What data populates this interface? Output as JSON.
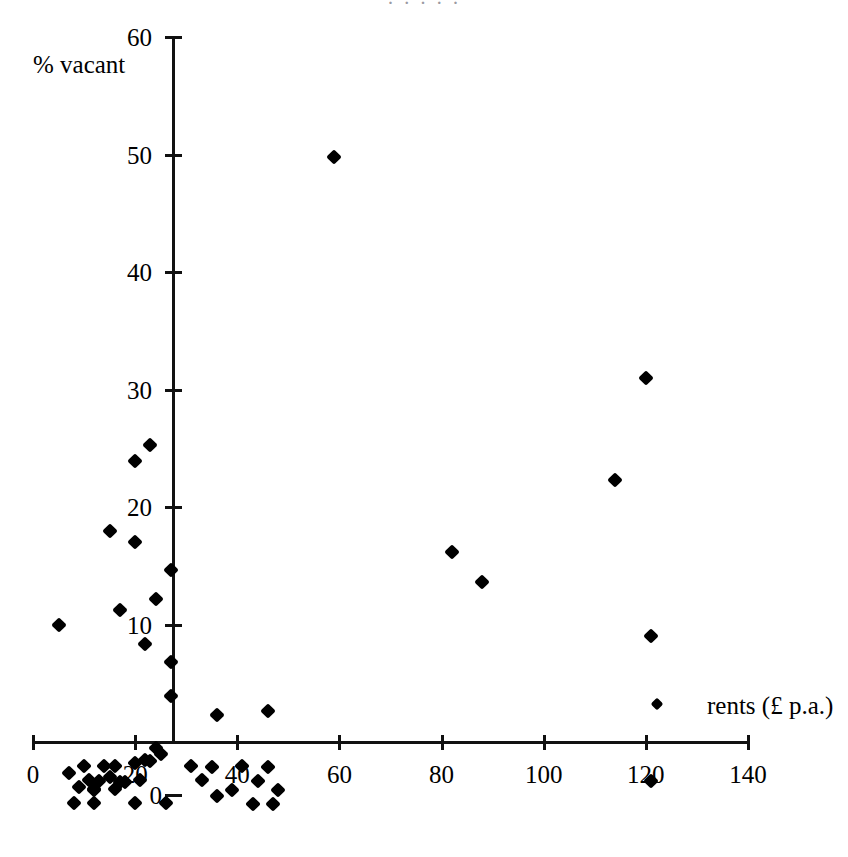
{
  "figure": {
    "background_color": "#ffffff",
    "ink_color": "#000000",
    "width": 848,
    "height": 857,
    "cropped_caption_remnant": "· ·   ·    ·    ·"
  },
  "axes": {
    "y_axis_title": "% vacant",
    "x_axis_title": "rents (£ p.a.)",
    "x_ticks": [
      0,
      20,
      40,
      60,
      80,
      100,
      120,
      140
    ],
    "y_ticks": [
      0,
      10,
      20,
      30,
      40,
      50,
      60
    ],
    "x_tick_labels": [
      "0",
      "20",
      "40",
      "60",
      "80",
      "100",
      "120",
      "140"
    ],
    "y_tick_labels": [
      "0",
      "10",
      "20",
      "30",
      "40",
      "50",
      "60"
    ],
    "x_origin_px": 33,
    "x_scale_px_per_unit": 5.107,
    "y_origin_px": 742,
    "y_scale_px_per_unit": 11.75,
    "xlim": [
      0,
      140
    ],
    "ylim": [
      -6,
      60
    ],
    "grid": false
  },
  "legend": {
    "marker_label": "rents (£ p.a.)",
    "marker_x_px": 657,
    "marker_y_px": 704
  },
  "chart_data": {
    "type": "scatter",
    "title": "",
    "xlabel": "rents (£ p.a.)",
    "ylabel": "% vacant",
    "xlim": [
      0,
      140
    ],
    "ylim": [
      -6,
      60
    ],
    "grid": false,
    "legend_position": "inside-right",
    "series": [
      {
        "name": "rents (£ p.a.)",
        "marker": "diamond",
        "color": "#000000",
        "points": [
          [
            59,
            49.8
          ],
          [
            120,
            31.0
          ],
          [
            114,
            22.3
          ],
          [
            82,
            16.2
          ],
          [
            88,
            13.6
          ],
          [
            121,
            9.0
          ],
          [
            121,
            -3.3
          ],
          [
            23,
            25.3
          ],
          [
            20,
            23.9
          ],
          [
            15,
            18.0
          ],
          [
            20,
            17.0
          ],
          [
            27,
            14.6
          ],
          [
            24,
            12.2
          ],
          [
            17,
            11.2
          ],
          [
            5,
            10.0
          ],
          [
            22,
            8.3
          ],
          [
            27,
            6.8
          ],
          [
            27,
            3.9
          ],
          [
            36,
            2.3
          ],
          [
            46,
            2.6
          ],
          [
            24,
            -0.5
          ],
          [
            25,
            -1.0
          ],
          [
            22,
            -1.5
          ],
          [
            23,
            -1.6
          ],
          [
            20,
            -1.8
          ],
          [
            10,
            -2.0
          ],
          [
            14,
            -2.0
          ],
          [
            16,
            -2.0
          ],
          [
            31,
            -2.0
          ],
          [
            35,
            -2.1
          ],
          [
            41,
            -2.0
          ],
          [
            46,
            -2.1
          ],
          [
            7,
            -2.6
          ],
          [
            15,
            -3.0
          ],
          [
            11,
            -3.2
          ],
          [
            13,
            -3.3
          ],
          [
            18,
            -3.4
          ],
          [
            17,
            -3.4
          ],
          [
            21,
            -3.2
          ],
          [
            33,
            -3.2
          ],
          [
            44,
            -3.3
          ],
          [
            9,
            -3.8
          ],
          [
            12,
            -4.0
          ],
          [
            12,
            -4.1
          ],
          [
            16,
            -4.0
          ],
          [
            39,
            -4.1
          ],
          [
            48,
            -4.1
          ],
          [
            36,
            -4.6
          ],
          [
            8,
            -5.2
          ],
          [
            12,
            -5.2
          ],
          [
            20,
            -5.2
          ],
          [
            26,
            -5.2
          ],
          [
            43,
            -5.3
          ],
          [
            47,
            -5.3
          ]
        ]
      }
    ]
  }
}
